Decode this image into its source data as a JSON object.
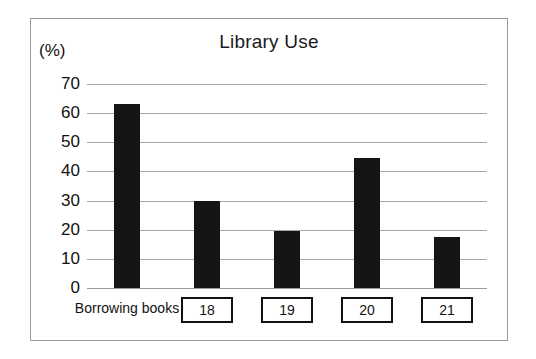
{
  "chart_data": {
    "type": "bar",
    "title": "Library Use",
    "unit_label": "(%)",
    "xlabel": "",
    "ylabel": "",
    "categories": [
      "Borrowing books",
      "18",
      "19",
      "20",
      "21"
    ],
    "values": [
      63,
      30,
      19.5,
      44.5,
      17.5
    ],
    "ylim": [
      0,
      70
    ],
    "ytick_values": [
      0,
      10,
      20,
      30,
      40,
      50,
      60,
      70
    ],
    "ytick_labels": [
      "0",
      "10",
      "20",
      "30",
      "40",
      "50",
      "60",
      "70"
    ],
    "grid": true,
    "legend": false,
    "bar_color": "#151515",
    "gridline_color": "#a6a6a6",
    "first_category_boxed": false,
    "boxed_categories": [
      "18",
      "19",
      "20",
      "21"
    ]
  },
  "frame": {
    "border_color": "#9a9a9a"
  }
}
